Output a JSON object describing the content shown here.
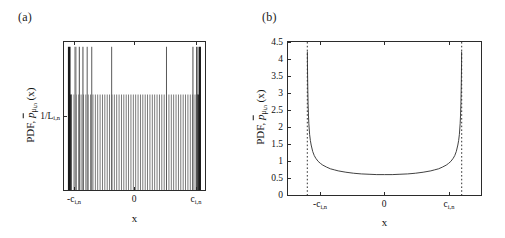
{
  "figure": {
    "background": "#ffffff",
    "width": 505,
    "height": 238,
    "line_color": "#2b2b2b"
  },
  "panels": [
    {
      "id": "a",
      "label": "(a)",
      "xlabel": "x",
      "ylabel_prefix": "PDF, ",
      "ylabel_symbol": "p",
      "ylabel_sub": "μ",
      "ylabel_sub2": "i,n",
      "ylabel_arg": "(x)",
      "xticks": [
        "-c",
        "0",
        "c"
      ],
      "xtick_subs": [
        "i,n",
        "",
        "i,n"
      ],
      "yticks": [
        "1/L"
      ],
      "ytick_subs": [
        "i,n"
      ],
      "box": {
        "left": 63,
        "top": 41,
        "width": 143,
        "height": 150
      }
    },
    {
      "id": "b",
      "label": "(b)",
      "xlabel": "x",
      "ylabel_prefix": "PDF, ",
      "ylabel_symbol": "p",
      "ylabel_sub": "μ",
      "ylabel_sub2": "i,n",
      "ylabel_arg": "(x)",
      "xticks": [
        "-c",
        "0",
        "c"
      ],
      "xtick_subs": [
        "i,n",
        "",
        "i,n"
      ],
      "yticks": [
        "0",
        "0.5",
        "1",
        "1.5",
        "2",
        "2.5",
        "3",
        "3.5",
        "4",
        "4.5"
      ],
      "box": {
        "left": 287,
        "top": 41,
        "width": 195,
        "height": 155
      }
    }
  ],
  "chart_data": [
    {
      "type": "bar",
      "panel": "a",
      "title": "(a)",
      "xlabel": "x",
      "ylabel": "PDF, p̄_{μ i,n}(x)",
      "xlim": [
        -1.08,
        1.08
      ],
      "ylim": [
        0,
        1.55
      ],
      "xtick_values": [
        -1,
        0,
        1
      ],
      "xtick_labels": [
        "-c_{i,n}",
        "0",
        "c_{i,n}"
      ],
      "ytick_values": [
        1
      ],
      "ytick_labels": [
        "1/L_{i,n}"
      ],
      "grid": false,
      "legend": null,
      "description": "Discrete/quantized PDF: dense comb of impulses of height 1/L_{i,n} filling [-c_{i,n}, c_{i,n}], with a subset of taller impulses extending well above 1/L_{i,n}.",
      "comb_height": 1.0,
      "comb_count": 56,
      "comb_x_start": -1.0,
      "comb_x_end": 1.0,
      "edge_bar_width": 2.5,
      "tall_spikes": [
        {
          "x": -1.0,
          "height": 1.5,
          "width": 2.6,
          "color": "#1a1a1a"
        },
        {
          "x": -0.905,
          "height": 1.5,
          "width": 2.2,
          "color": "#8c8c8c"
        },
        {
          "x": -0.845,
          "height": 1.5,
          "width": 1.1,
          "color": "#5a5a5a"
        },
        {
          "x": -0.79,
          "height": 1.5,
          "width": 1.1,
          "color": "#5a5a5a"
        },
        {
          "x": -0.725,
          "height": 1.5,
          "width": 1.0,
          "color": "#5a5a5a"
        },
        {
          "x": -0.655,
          "height": 1.5,
          "width": 1.0,
          "color": "#5a5a5a"
        },
        {
          "x": -0.35,
          "height": 1.5,
          "width": 1.0,
          "color": "#5a5a5a"
        },
        {
          "x": 0.49,
          "height": 1.5,
          "width": 1.0,
          "color": "#5a5a5a"
        },
        {
          "x": 0.895,
          "height": 1.5,
          "width": 1.1,
          "color": "#5a5a5a"
        },
        {
          "x": 0.955,
          "height": 1.5,
          "width": 1.4,
          "color": "#3a3a3a"
        },
        {
          "x": 1.0,
          "height": 1.5,
          "width": 2.4,
          "color": "#1a1a1a"
        }
      ]
    },
    {
      "type": "line",
      "panel": "b",
      "title": "(b)",
      "xlabel": "x",
      "ylabel": "PDF, p̄_{μ i,n}(x)",
      "xlim": [
        -1.25,
        1.25
      ],
      "ylim": [
        0,
        4.5
      ],
      "xtick_values": [
        -1,
        0,
        1
      ],
      "xtick_labels": [
        "-c_{i,n}",
        "0",
        "c_{i,n}"
      ],
      "ytick_values": [
        0,
        0.5,
        1,
        1.5,
        2,
        2.5,
        3,
        3.5,
        4,
        4.5
      ],
      "ytick_labels": [
        "0",
        "0.5",
        "1",
        "1.5",
        "2",
        "2.5",
        "3",
        "3.5",
        "4",
        "4.5"
      ],
      "grid": false,
      "legend": null,
      "description": "Continuous U-shaped (arcsine-like) PDF supported on [-c_{i,n}, c_{i,n}] with minimum ~0.6 at x=0, rising steeply to ~4.2 at the edges; vertical dotted asymptote lines drawn at x = ±c_{i,n}.",
      "asymptotes_x": [
        -1,
        1
      ],
      "asymptote_style": "dotted",
      "minimum_value": 0.6,
      "edge_peak_value": 4.2,
      "x": [
        -1.0,
        -0.999,
        -0.998,
        -0.996,
        -0.993,
        -0.99,
        -0.985,
        -0.98,
        -0.97,
        -0.96,
        -0.95,
        -0.93,
        -0.91,
        -0.89,
        -0.86,
        -0.83,
        -0.8,
        -0.75,
        -0.7,
        -0.65,
        -0.6,
        -0.5,
        -0.4,
        -0.3,
        -0.2,
        -0.1,
        0.0,
        0.1,
        0.2,
        0.3,
        0.4,
        0.5,
        0.6,
        0.65,
        0.7,
        0.75,
        0.8,
        0.83,
        0.86,
        0.89,
        0.91,
        0.93,
        0.95,
        0.96,
        0.97,
        0.98,
        0.985,
        0.99,
        0.993,
        0.996,
        0.998,
        0.999,
        1.0
      ],
      "y": [
        4.22,
        4.22,
        3.9,
        3.45,
        3.05,
        2.7,
        2.35,
        2.1,
        1.78,
        1.6,
        1.47,
        1.28,
        1.16,
        1.08,
        0.99,
        0.93,
        0.88,
        0.82,
        0.77,
        0.74,
        0.71,
        0.67,
        0.64,
        0.62,
        0.61,
        0.6,
        0.6,
        0.6,
        0.61,
        0.62,
        0.64,
        0.67,
        0.71,
        0.74,
        0.77,
        0.82,
        0.88,
        0.93,
        0.99,
        1.08,
        1.16,
        1.28,
        1.47,
        1.6,
        1.78,
        2.1,
        2.35,
        2.7,
        3.05,
        3.45,
        3.9,
        4.22,
        4.22
      ]
    }
  ]
}
